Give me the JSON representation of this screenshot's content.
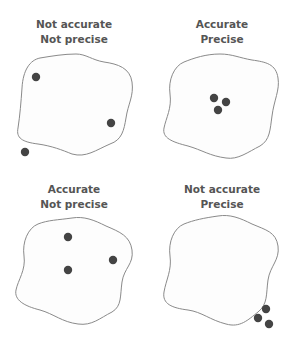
{
  "colors": {
    "dot": "#444444",
    "outline": "#888888",
    "fill": "#fdfdfd",
    "text": "#555555"
  },
  "panels": [
    {
      "id": "not-accurate-not-precise",
      "title_line1": "Not accurate",
      "title_line2": "Not precise"
    },
    {
      "id": "accurate-precise",
      "title_line1": "Accurate",
      "title_line2": "Precise"
    },
    {
      "id": "accurate-not-precise",
      "title_line1": "Accurate",
      "title_line2": "Not precise"
    },
    {
      "id": "not-accurate-precise",
      "title_line1": "Not accurate",
      "title_line2": "Precise"
    }
  ]
}
